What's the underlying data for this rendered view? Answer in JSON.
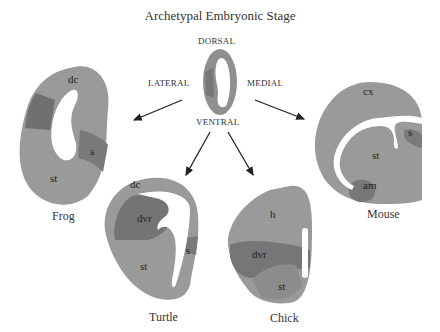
{
  "title": "Archetypal Embryonic Stage",
  "orientation": {
    "dorsal": "DORSAL",
    "ventral": "VENTRAL",
    "lateral": "LATERAL",
    "medial": "MEDIAL"
  },
  "species": [
    {
      "name": "Frog",
      "regions": [
        "dc",
        "s",
        "st"
      ]
    },
    {
      "name": "Turtle",
      "regions": [
        "dc",
        "dvr",
        "s",
        "st"
      ]
    },
    {
      "name": "Chick",
      "regions": [
        "h",
        "dvr",
        "st"
      ]
    },
    {
      "name": "Mouse",
      "regions": [
        "cx",
        "s",
        "st",
        "am"
      ]
    }
  ],
  "colors": {
    "light": "#9a9a9a",
    "medium": "#8a8a8a",
    "dark": "#6e6e6e",
    "ventricle": "#ffffff",
    "arrow": "#222222"
  }
}
